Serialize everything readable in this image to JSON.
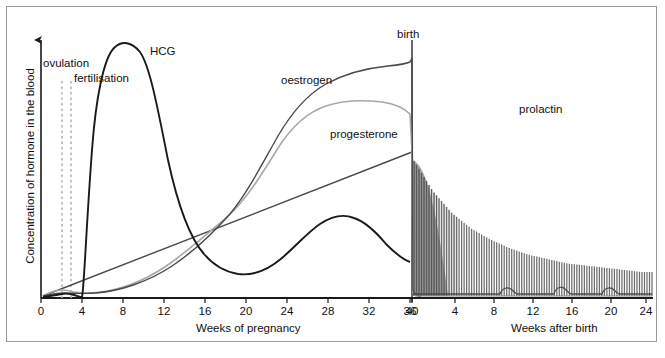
{
  "figure": {
    "caption_fragment": ""
  },
  "axes": {
    "y_label": "Concentration of hormone in the blood",
    "x_label_left": "Weeks of pregnancy",
    "x_label_right": "Weeks after birth",
    "x_ticks_left": [
      "0",
      "4",
      "8",
      "12",
      "16",
      "20",
      "24",
      "28",
      "32",
      "36",
      "40"
    ],
    "x_ticks_right": [
      "4",
      "8",
      "12",
      "16",
      "20",
      "24"
    ]
  },
  "annotations": {
    "ovulation": "ovulation",
    "fertilisation": "fertilisation",
    "birth": "birth"
  },
  "curves": {
    "hcg": "HCG",
    "oestrogen": "oestrogen",
    "progesterone": "progesterone",
    "prolactin": "prolactin"
  },
  "colors": {
    "hcg": "#1a1a1a",
    "oestrogen": "#4a4a4a",
    "progesterone": "#a8a8a8",
    "prolactin": "#555555",
    "axis": "#1a1a1a",
    "frame": "#9a9a9a",
    "dashed": "#b5b5b5"
  },
  "chart_data": {
    "type": "line",
    "xlabel": "Weeks of pregnancy / Weeks after birth",
    "ylabel": "Concentration of hormone in the blood",
    "grid": false,
    "legend": "inline-curve-labels",
    "xlim_pregnancy": [
      0,
      40
    ],
    "xlim_postbirth": [
      0,
      25
    ],
    "ylim": [
      0,
      100
    ],
    "event_markers": [
      {
        "label": "ovulation",
        "x_weeks": 2.0,
        "style": "dashed-vertical"
      },
      {
        "label": "fertilisation",
        "x_weeks": 2.8,
        "style": "dashed-vertical"
      },
      {
        "label": "birth",
        "x_weeks": 40,
        "style": "solid-vertical"
      }
    ],
    "series": [
      {
        "name": "HCG",
        "color": "#1a1a1a",
        "phase": "pregnancy",
        "x": [
          0,
          2,
          3,
          3.5,
          4,
          5,
          6,
          7,
          8,
          9,
          10,
          11,
          12,
          14,
          16,
          18,
          20,
          21,
          24,
          28,
          30,
          32,
          34,
          36,
          38,
          40
        ],
        "y": [
          0,
          0,
          1,
          2,
          12,
          46,
          72,
          86,
          93,
          95,
          93,
          88,
          80,
          64,
          50,
          38,
          28,
          25,
          24,
          27,
          30,
          31,
          30,
          27,
          25,
          24
        ]
      },
      {
        "name": "oestrogen",
        "color": "#4a4a4a",
        "phase": "pregnancy",
        "x": [
          0,
          2,
          3,
          4,
          6,
          8,
          10,
          12,
          14,
          16,
          18,
          20,
          22,
          24,
          26,
          28,
          30,
          32,
          34,
          36,
          38,
          39.5,
          40,
          40.3
        ],
        "y": [
          0,
          2,
          3,
          3,
          4,
          5,
          6,
          8,
          11,
          14,
          18,
          24,
          32,
          42,
          52,
          62,
          70,
          77,
          82,
          86,
          88,
          89,
          90,
          2
        ]
      },
      {
        "name": "progesterone",
        "color": "#a8a8a8",
        "phase": "pregnancy",
        "x": [
          0,
          2,
          3,
          4,
          6,
          8,
          10,
          12,
          14,
          16,
          18,
          20,
          22,
          24,
          26,
          28,
          30,
          32,
          34,
          36,
          38,
          40,
          40.3
        ],
        "y": [
          0,
          3,
          4,
          4,
          4,
          5,
          6,
          7,
          9,
          12,
          16,
          22,
          30,
          38,
          47,
          54,
          60,
          64,
          66,
          67,
          66,
          64,
          2
        ]
      },
      {
        "name": "secondary-rising-line",
        "color": "#4a4a4a",
        "phase": "pregnancy",
        "x": [
          0,
          4,
          8,
          12,
          16,
          20,
          24,
          28,
          32,
          36,
          40
        ],
        "y": [
          0,
          2,
          6,
          10,
          15,
          24,
          32,
          40,
          48,
          56,
          64
        ]
      },
      {
        "name": "prolactin",
        "color": "#555555",
        "phase": "both",
        "style": "pulsatile-spikes",
        "description": "Rises through pregnancy, peaks at birth, then decays as dense suckling-driven pulses",
        "x_postbirth": [
          0,
          1,
          2,
          4,
          6,
          8,
          10,
          12,
          14,
          16,
          18,
          20,
          22,
          24,
          25
        ],
        "y_envelope": [
          62,
          55,
          48,
          38,
          31,
          26,
          22,
          19,
          17,
          15,
          14,
          13,
          12,
          11,
          11
        ],
        "spike_count": 96
      },
      {
        "name": "post-birth oestrogen/progesterone cycles",
        "color": "#4a4a4a",
        "phase": "postbirth",
        "x": [
          0,
          2,
          4,
          6,
          8,
          10,
          11,
          12,
          14,
          15,
          16,
          18,
          19,
          20,
          22,
          23,
          24,
          25
        ],
        "y": [
          2,
          2,
          2,
          2,
          2,
          3,
          6,
          3,
          3,
          7,
          3,
          3,
          7,
          3,
          3,
          6,
          3,
          3
        ]
      }
    ]
  }
}
